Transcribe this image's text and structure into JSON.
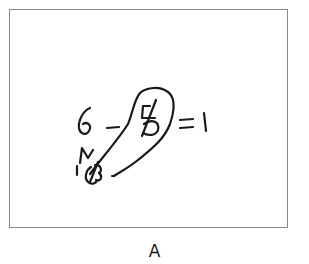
{
  "figure": {
    "caption": "A",
    "handwriting": {
      "expression": "6 - 5 = 1",
      "description": "Handwritten subtraction with the 5 crossed out, a lasso loop dragging it down-left to a crossed-out annotation",
      "ink_color": "#1a1a1a",
      "border_color": "#8a8a8a"
    },
    "strokes": [
      {
        "name": "digit-6"
      },
      {
        "name": "minus-sign"
      },
      {
        "name": "digit-5-struck"
      },
      {
        "name": "strike-through-5"
      },
      {
        "name": "equals-sign"
      },
      {
        "name": "digit-1"
      },
      {
        "name": "lasso-loop"
      },
      {
        "name": "scribble-n"
      },
      {
        "name": "annotation-16-struck"
      }
    ]
  }
}
